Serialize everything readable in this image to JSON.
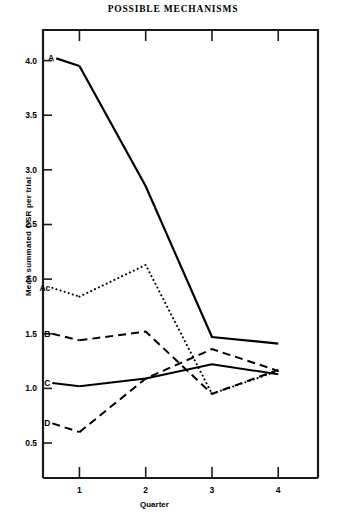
{
  "chart_data": {
    "type": "line",
    "title": "POSSIBLE MECHANISMS",
    "xlabel": "Quarter",
    "ylabel": "Mean summated GSR per trial",
    "x": [
      1,
      2,
      3,
      4
    ],
    "xticklabels": [
      "1",
      "2",
      "3",
      "4"
    ],
    "yticks": [
      0.5,
      1.0,
      1.5,
      2.0,
      2.5,
      3.0,
      3.5,
      4.0
    ],
    "yticklabels": [
      "0.5",
      "1.0",
      "1.5",
      "2.0",
      "2.5",
      "3.0",
      "3.5",
      "4.0"
    ],
    "ylim": [
      0.18,
      4.28
    ],
    "xlim": [
      0.45,
      4.6
    ],
    "grid": false,
    "legend": "inline-labels-at-left",
    "series": [
      {
        "name": "A",
        "label": "A",
        "style": "solid",
        "width": 2.2,
        "color": "#000000",
        "values": [
          3.95,
          2.85,
          1.47,
          1.41
        ]
      },
      {
        "name": "Ac",
        "label": "Ac",
        "style": "dotted",
        "width": 2.0,
        "color": "#000000",
        "values": [
          1.84,
          2.13,
          0.95,
          1.16
        ]
      },
      {
        "name": "B",
        "label": "B",
        "style": "dashed",
        "width": 2.0,
        "color": "#000000",
        "values": [
          1.44,
          1.52,
          0.95,
          1.17
        ]
      },
      {
        "name": "C",
        "label": "C",
        "style": "solid",
        "width": 2.0,
        "color": "#000000",
        "values": [
          1.02,
          1.09,
          1.22,
          1.13
        ]
      },
      {
        "name": "D",
        "label": "D",
        "style": "dashed",
        "width": 2.0,
        "color": "#000000",
        "values": [
          0.6,
          1.09,
          1.36,
          1.16
        ]
      }
    ],
    "label_anchors": [
      {
        "name": "A",
        "x": 0.62,
        "y": 4.02
      },
      {
        "name": "Ac",
        "x": 0.56,
        "y": 1.92
      },
      {
        "name": "B",
        "x": 0.56,
        "y": 1.5
      },
      {
        "name": "C",
        "x": 0.56,
        "y": 1.05
      },
      {
        "name": "D",
        "x": 0.56,
        "y": 0.68
      }
    ],
    "axis_color": "#1a1a1a"
  }
}
